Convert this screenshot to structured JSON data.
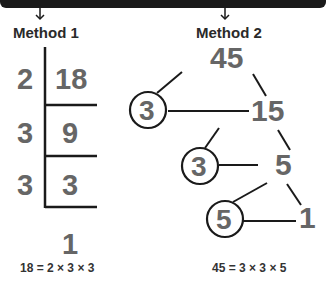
{
  "method1": {
    "heading": "Method 1",
    "divisors": [
      "2",
      "3",
      "3"
    ],
    "dividends": [
      "18",
      "9",
      "3"
    ],
    "remainder": "1",
    "equation": "18 = 2 × 3 × 3"
  },
  "method2": {
    "heading": "Method 2",
    "nodes": {
      "root": "45",
      "n1": "15",
      "n2": "5",
      "n3": "1"
    },
    "circled": [
      "3",
      "3",
      "5"
    ],
    "equation": "45 = 3 × 3 × 5"
  },
  "colors": {
    "line": "#1a1a1a",
    "number": "#666666",
    "text": "#2a2a2a"
  }
}
